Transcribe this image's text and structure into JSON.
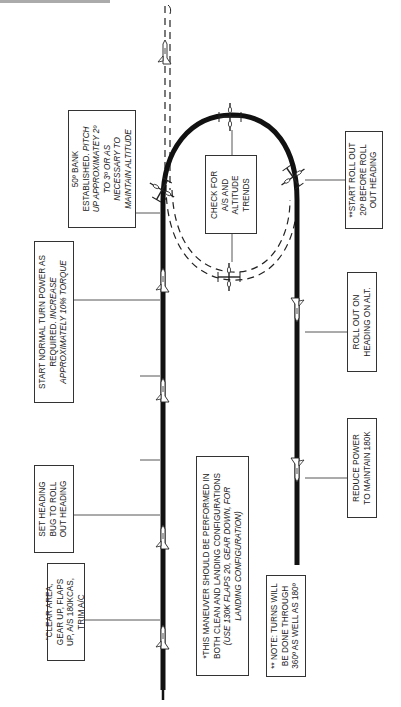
{
  "diagram": {
    "type": "flight-maneuver-diagram",
    "orientation": "rotated-90-ccw",
    "colors": {
      "flight_path": "#111111",
      "dashed_path": "#222222",
      "box_border": "#333333",
      "text": "#222222",
      "background": "#ffffff"
    }
  },
  "boxes": {
    "clear_area": {
      "lines": [
        "\"CLEAR AREA,",
        "GEAR UP, FLAPS",
        "UP, A/S 180KCAS,",
        "TRIM A/C"
      ]
    },
    "set_heading": {
      "lines": [
        "SET HEADING",
        "BUG TO ROLL",
        "OUT HEADING"
      ]
    },
    "start_turn": {
      "line1": "START NORMAL TURN POWER AS",
      "line2a": "REQUIRED. ",
      "line2b": "INCREASE",
      "line3": "APPROXIMATELY 10% TORQUE"
    },
    "bank_established": {
      "line1": "50º BANK",
      "line2a": "ESTABLISHED. ",
      "line2b": "PITCH",
      "line3": "UP APPROXIMATEY 2º",
      "line4": "TO 3º OR AS",
      "line5": "NECESSARY TO",
      "line6": "MAINTAIN ALTITUDE"
    },
    "check_trends": {
      "lines": [
        "CHECK FOR",
        "A/S AND",
        "ALTITUDE",
        "TRENDS"
      ]
    },
    "start_rollout": {
      "lines": [
        "**START ROLL OUT",
        "20º BEFORE ROLL",
        "OUT HEADING"
      ]
    },
    "roll_out": {
      "lines": [
        "ROLL OUT ON",
        "HEADING ON ALT."
      ]
    },
    "reduce_power": {
      "lines": [
        "REDUCE POWER",
        "TO MAINTAIN 180K"
      ]
    },
    "maneuver_note": {
      "line1": "*THIS MANEUVER SHOULD BE PERFORMED IN",
      "line2": "BOTH CLEAN AND LANDING CONFIGURATIONS",
      "line3a": "(USE 130K ",
      "line3b": "FLAPS 20, GEAR DOWN, FOR",
      "line4": "LANDING CONFIGURATION)"
    },
    "turns_note": {
      "lines": [
        "** NOTE:  TURNS WILL",
        "BE DONE THROUGH",
        "360º AS WELL AS 180º"
      ]
    }
  },
  "icons": {
    "aircraft_count": 11
  }
}
